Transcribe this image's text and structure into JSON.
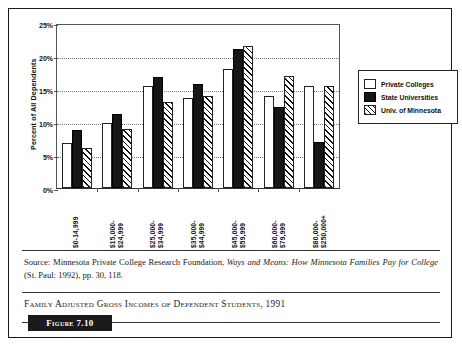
{
  "chart_data": {
    "type": "bar",
    "title": "",
    "xlabel": "",
    "ylabel": "Percent of All Dependents",
    "ylim": [
      0,
      25
    ],
    "ytick_labels": [
      "0%",
      "5%",
      "10%",
      "15%",
      "20%",
      "25%"
    ],
    "ytick_values": [
      0,
      5,
      10,
      15,
      20,
      25
    ],
    "grid": true,
    "legend_position": "right",
    "categories": [
      "$0-14,999",
      "$15,000-\n$24,999",
      "$25,000-\n$34,999",
      "$35,000-\n$44,999",
      "$45,000-\n$59,999",
      "$60,000-\n$79,999",
      "$80,000-\n$250,000+"
    ],
    "category_lines": [
      [
        "$0-14,999"
      ],
      [
        "$15,000-",
        "$24,999"
      ],
      [
        "$25,000-",
        "$34,999"
      ],
      [
        "$35,000-",
        "$44,999"
      ],
      [
        "$45,000-",
        "$59,999"
      ],
      [
        "$60,000-",
        "$79,999"
      ],
      [
        "$80,000-",
        "$250,000+"
      ]
    ],
    "series": [
      {
        "name": "Private Colleges",
        "key": "private",
        "values": [
          6.8,
          9.8,
          15.5,
          13.7,
          18.0,
          14.0,
          15.5
        ]
      },
      {
        "name": "State Universities",
        "key": "state",
        "values": [
          8.8,
          11.2,
          16.8,
          15.7,
          21.0,
          12.3,
          7.0
        ]
      },
      {
        "name": "Univ. of Minnesota",
        "key": "uofm",
        "values": [
          6.0,
          9.0,
          13.0,
          14.0,
          21.5,
          17.0,
          15.5
        ]
      }
    ]
  },
  "legend": {
    "items": [
      {
        "label": "Private Colleges",
        "key": "private"
      },
      {
        "label": "State Universities",
        "key": "state"
      },
      {
        "label": "Univ. of Minnesota",
        "key": "uofm"
      }
    ]
  },
  "source": {
    "prefix": "Source: Minnesota Private College Research Foundation, ",
    "italic_title": "Ways and Means: How Minnesota Families Pay for College",
    "suffix": " (St. Paul: 1992), pp. 30, 118."
  },
  "caption": {
    "text": "Family Adjusted Gross Incomes of Dependent Students, 1991"
  },
  "figure_badge": {
    "label": "Figure 7.10"
  },
  "colors": {
    "private": "#ffffff",
    "state": "#161616",
    "hatch": "#111111",
    "frame": "#1a1a1a",
    "badge_bg": "#1b1b1b",
    "badge_text": "#ffffff"
  }
}
